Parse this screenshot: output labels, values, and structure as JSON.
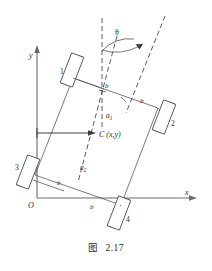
{
  "figure": {
    "caption_label": "图",
    "caption_number": "2.17",
    "axes": {
      "y_label": "y",
      "x_label": "x",
      "origin_label": "O"
    },
    "angle": {
      "symbol": "θ"
    },
    "center": {
      "label": "C (x,y)"
    },
    "distances": {
      "a1": "a",
      "a1_sub": "1",
      "a2": "a",
      "a2_sub": "2",
      "b": "b"
    },
    "wheels": [
      {
        "id": "1",
        "label": "1"
      },
      {
        "id": "2",
        "label": "2"
      },
      {
        "id": "3",
        "label": "3"
      },
      {
        "id": "4",
        "label": "4"
      }
    ],
    "b_labels": [
      "b",
      "b",
      "b",
      "b"
    ],
    "colors": {
      "line": "#585858",
      "axis": "#6b6b6b",
      "dashed": "#4a4a4a",
      "text": "#2b2b2b",
      "background": "#ffffff"
    }
  }
}
